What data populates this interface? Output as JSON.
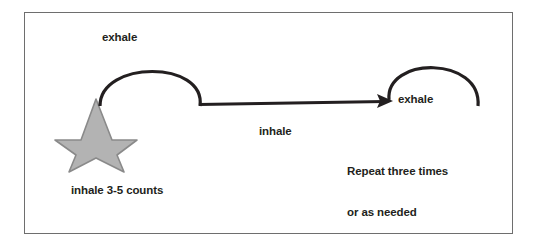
{
  "diagram": {
    "background_color": "#ffffff",
    "border_color": "#6e6e6e",
    "stroke_color": "#231f20",
    "star": {
      "name": "star-shape",
      "fill_color": "#b3b3b3",
      "outline_color": "#808080",
      "points": 5
    },
    "labels": {
      "exhale_left": "exhale",
      "inhale_middle": "inhale",
      "exhale_right": "exhale",
      "repeat_line1": "Repeat three times",
      "repeat_line2": "or as needed",
      "inhale_counts": "inhale 3-5 counts"
    }
  }
}
